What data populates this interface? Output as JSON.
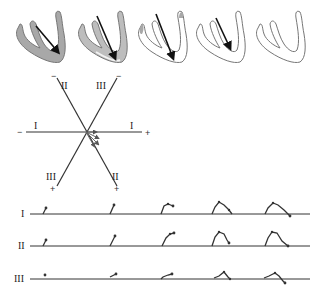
{
  "figure": {
    "colors": {
      "myocardium_depolarized": "#a8a8a8",
      "myocardium_outline": "#777777",
      "vector_arrow": "#111111",
      "axis_line": "#333333",
      "trace": "#333333"
    }
  },
  "heart_panels": [
    {
      "step": 1,
      "depolarized_fraction": "full",
      "vector": "septal-to-apex, short"
    },
    {
      "step": 2,
      "depolarized_fraction": "most",
      "vector": "long, toward apex"
    },
    {
      "step": 3,
      "depolarized_fraction": "partial tips",
      "vector": "long, toward apex"
    },
    {
      "step": 4,
      "depolarized_fraction": "minimal",
      "vector": "shorter, toward apex"
    },
    {
      "step": 5,
      "depolarized_fraction": "none",
      "vector": "none"
    }
  ],
  "hexaxial": {
    "leads": [
      {
        "name": "I",
        "label_left": "I",
        "label_right": "I",
        "neg": "−",
        "pos": "+"
      },
      {
        "name": "II",
        "label_top": "II",
        "label_bottom": "II",
        "neg": "−",
        "pos": "+"
      },
      {
        "name": "III",
        "label_top": "III",
        "label_bottom": "III",
        "neg": "−",
        "pos": "+"
      }
    ]
  },
  "traces": {
    "leads": [
      {
        "label": "I"
      },
      {
        "label": "II"
      },
      {
        "label": "III"
      }
    ],
    "segments_per_lead": 5
  }
}
